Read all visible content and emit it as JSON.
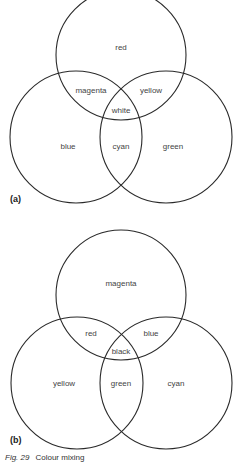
{
  "diagrams": [
    {
      "id": "a",
      "tag": "(a)",
      "title": "Additive colour mixing",
      "circles": [
        {
          "name": "red",
          "cx": 121,
          "cy": 55,
          "r": 65
        },
        {
          "name": "blue",
          "cx": 76,
          "cy": 137,
          "r": 66
        },
        {
          "name": "green",
          "cx": 166,
          "cy": 137,
          "r": 66
        }
      ],
      "labels": {
        "top": "red",
        "left": "blue",
        "right": "green",
        "top_left": "magenta",
        "top_right": "yellow",
        "bottom_center": "cyan",
        "center": "white"
      }
    },
    {
      "id": "b",
      "tag": "(b)",
      "title": "Subtractive colour mixing",
      "circles": [
        {
          "name": "magenta",
          "cx": 121,
          "cy": 295,
          "r": 65
        },
        {
          "name": "yellow",
          "cx": 77,
          "cy": 383,
          "r": 66
        },
        {
          "name": "cyan",
          "cx": 166,
          "cy": 383,
          "r": 66
        }
      ],
      "labels": {
        "top": "magenta",
        "left": "yellow",
        "right": "cyan",
        "top_left": "red",
        "top_right": "blue",
        "bottom_center": "green",
        "center": "black"
      }
    }
  ],
  "caption": {
    "figure": "Fig. 29",
    "text": "Colour mixing"
  },
  "colors": {
    "stroke": "#2a2a2a",
    "text": "#444444"
  }
}
